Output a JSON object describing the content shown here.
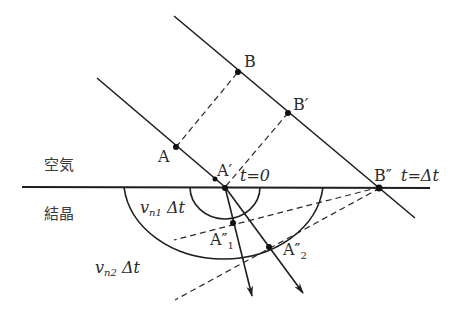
{
  "figure": {
    "type": "Huygens construction of wave refraction into a crystal (double refraction)",
    "regions": {
      "upper": "空気",
      "lower": "結晶"
    },
    "points": {
      "A": "A",
      "B": "B",
      "B_prime": "B′",
      "A_prime": "A′",
      "B_double_prime": "B″",
      "A1_double_prime": "A″",
      "A1_sub": "1",
      "A2_double_prime": "A″",
      "A2_sub": "2"
    },
    "time_labels": {
      "t0": "t=0",
      "t_dt": "t=Δt"
    },
    "radius_labels": {
      "r1_v": "v",
      "r1_sub": "n1",
      "r1_rest": " Δt",
      "r2_v": "v",
      "r2_sub": "n2",
      "r2_rest": " Δt"
    },
    "colors": {
      "line": "#1e1e1e",
      "text": "#2a2a2a",
      "background": "#ffffff"
    }
  }
}
